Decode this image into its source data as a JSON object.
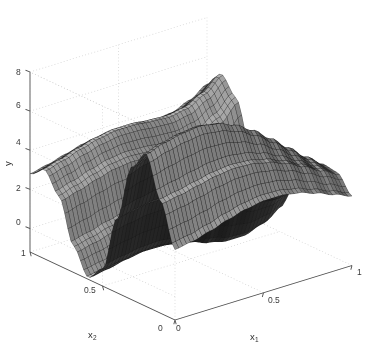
{
  "figure": {
    "kind": "3d-mesh-surface",
    "background": "#ffffff",
    "mesh_color": "#2b2b2b",
    "mesh_highlight": "#8d8d8d",
    "axis_color": "#4d4d4d",
    "grid_color": "#c9c9c9",
    "width": 375,
    "height": 354
  },
  "axes": {
    "y": {
      "label": "y",
      "ticks": [
        "0",
        "2",
        "4",
        "6",
        "8"
      ],
      "tick_values": [
        0,
        2,
        4,
        6,
        8
      ],
      "range": [
        -1.2,
        8
      ]
    },
    "x1": {
      "label": "x",
      "sub": "1",
      "ticks": [
        "0",
        "0.5",
        "1"
      ],
      "tick_values": [
        0,
        0.5,
        1
      ],
      "range": [
        0,
        1
      ]
    },
    "x2": {
      "label": "x",
      "sub": "2",
      "ticks": [
        "0",
        "0.5",
        "1"
      ],
      "tick_values": [
        0,
        0.5,
        1
      ],
      "range": [
        0,
        1
      ]
    }
  },
  "chart_data": {
    "type": "surface",
    "title": "",
    "xlabel": "x1",
    "ylabel": "x2",
    "zlabel": "y",
    "grid": true,
    "legend": false,
    "xlim": [
      0,
      1
    ],
    "ylim": [
      0,
      1
    ],
    "zlim": [
      -1.2,
      8
    ],
    "zticks": [
      0,
      2,
      4,
      6,
      8
    ],
    "xticks": [
      0,
      0.5,
      1
    ],
    "yticks": [
      0,
      0.5,
      1
    ],
    "mesh_n": 46,
    "view": {
      "azimuth": -37.5,
      "elevation": 22
    },
    "surface_note": "Wavy saddle-like surface: tall ridge near x2=0.25 peaking about 7.2, deep trough at the front corner dropping to about -1.1, secondary ridge along the right-hand x1 edge.",
    "z_extent": {
      "min": -1.1,
      "max": 7.2
    },
    "grid_x1": [
      0,
      0.1,
      0.2,
      0.3,
      0.4,
      0.5,
      0.6,
      0.7,
      0.8,
      0.9,
      1
    ],
    "grid_x2": [
      0,
      0.1,
      0.2,
      0.3,
      0.4,
      0.5,
      0.6,
      0.7,
      0.8,
      0.9,
      1
    ],
    "z_matrix": [
      [
        2.4,
        2.55,
        2.8,
        3.1,
        3.35,
        3.5,
        3.5,
        3.35,
        3.05,
        2.7,
        2.35
      ],
      [
        4.55,
        4.7,
        4.9,
        5.1,
        5.2,
        5.15,
        4.95,
        4.6,
        4.15,
        3.65,
        3.2
      ],
      [
        6.6,
        6.9,
        7.1,
        7.2,
        7.05,
        6.7,
        6.15,
        5.45,
        4.7,
        3.95,
        3.3
      ],
      [
        5.55,
        5.85,
        6.05,
        6.1,
        5.9,
        5.5,
        4.9,
        4.2,
        3.5,
        2.9,
        2.5
      ],
      [
        2.6,
        2.8,
        2.95,
        2.95,
        2.75,
        2.4,
        1.95,
        1.5,
        1.2,
        1.1,
        1.3
      ],
      [
        -0.35,
        -0.2,
        -0.05,
        0.0,
        -0.1,
        -0.35,
        -0.65,
        -0.85,
        -0.85,
        -0.55,
        0.05
      ],
      [
        -1.1,
        -0.95,
        -0.75,
        -0.6,
        -0.6,
        -0.7,
        -0.85,
        -0.9,
        -0.7,
        -0.15,
        0.7
      ],
      [
        0.15,
        0.35,
        0.6,
        0.8,
        0.85,
        0.8,
        0.7,
        0.7,
        0.95,
        1.55,
        2.4
      ],
      [
        2.35,
        2.6,
        2.9,
        3.15,
        3.25,
        3.2,
        3.1,
        3.05,
        3.25,
        3.8,
        4.6
      ],
      [
        3.35,
        3.6,
        3.9,
        4.15,
        4.3,
        4.3,
        4.2,
        4.15,
        4.3,
        4.75,
        5.45
      ],
      [
        2.8,
        3.0,
        3.25,
        3.5,
        3.65,
        3.7,
        3.65,
        3.6,
        3.7,
        4.05,
        4.6
      ]
    ]
  },
  "ticklabels": {
    "y8": "8",
    "y6": "6",
    "y4": "4",
    "y2": "2",
    "y0": "0",
    "x2_1": "1",
    "x2_05": "0.5",
    "x2_0": "0",
    "x1_0": "0",
    "x1_05": "0.5",
    "x1_1": "1"
  }
}
